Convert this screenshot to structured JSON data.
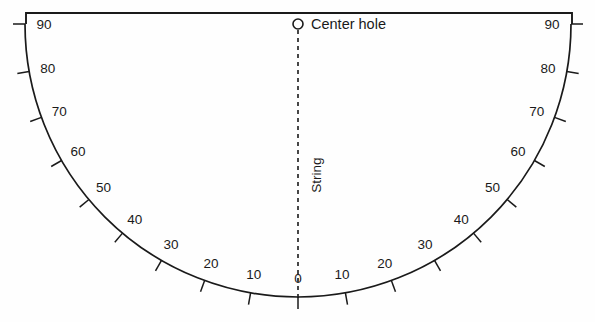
{
  "diagram": {
    "background_color": "#fefefe",
    "line_color": "#1a1a1a",
    "center_hole": {
      "label": "Center hole",
      "icon": "circle-icon",
      "x": 298,
      "y": 24,
      "radius": 5
    },
    "string": {
      "label": "String",
      "orientation": "vertical",
      "style": "dashed",
      "from_y": 30,
      "to_y": 300
    },
    "top_bar": {
      "left_x": 26,
      "right_x": 572,
      "y": 13,
      "end_tick_length": 11
    },
    "arc": {
      "center_x": 298,
      "center_y": 24,
      "radius": 273,
      "start_angle_deg": -90,
      "end_angle_deg": 90,
      "tick_length": 12,
      "label_offset": 19
    },
    "scale": {
      "units": "degrees",
      "left_labels": [
        "90",
        "80",
        "70",
        "60",
        "50",
        "40",
        "30",
        "20",
        "10"
      ],
      "center_label": "0",
      "right_labels": [
        "10",
        "20",
        "30",
        "40",
        "50",
        "60",
        "70",
        "80",
        "90"
      ],
      "left_values": [
        90,
        80,
        70,
        60,
        50,
        40,
        30,
        20,
        10
      ],
      "right_values": [
        10,
        20,
        30,
        40,
        50,
        60,
        70,
        80,
        90
      ],
      "step": 10,
      "min": 0,
      "max": 90
    }
  }
}
